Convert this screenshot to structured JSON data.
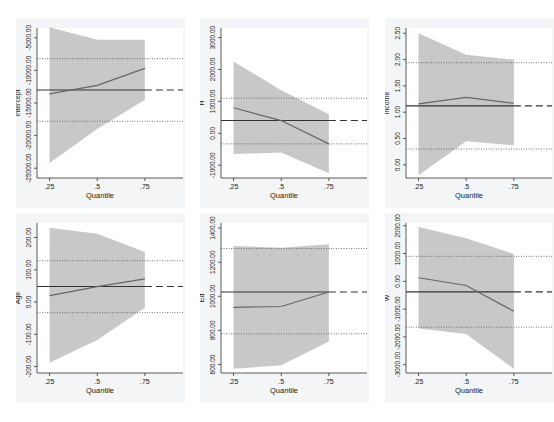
{
  "chart_data": [
    {
      "type": "line",
      "title": "",
      "ylabel": "Intercept",
      "xlabel": "Quantile",
      "x": [
        0.25,
        0.5,
        0.75
      ],
      "xticks": [
        ".25",
        ".5",
        ".75"
      ],
      "yticks": [
        -25000,
        -20000,
        -15000,
        -10000,
        -5000
      ],
      "ytick_labels": [
        "-25000.00",
        "-20000.00",
        "-15000.00",
        "-10000.00",
        "-5000.00"
      ],
      "ylim": [
        -26500,
        -3500
      ],
      "series": [
        {
          "name": "quantile estimate",
          "values": [
            -13600,
            -12300,
            -9700
          ]
        },
        {
          "name": "ci_lower",
          "values": [
            -24200,
            -19000,
            -14500
          ]
        },
        {
          "name": "ci_upper",
          "values": [
            -3400,
            -5300,
            -5300
          ]
        }
      ],
      "ols": -13000,
      "ols_ci": [
        -17800,
        -8200
      ]
    },
    {
      "type": "line",
      "title": "",
      "ylabel": "H",
      "xlabel": "Quantile",
      "x": [
        0.25,
        0.5,
        0.75
      ],
      "xticks": [
        ".25",
        ".5",
        ".75"
      ],
      "yticks": [
        -1000,
        0,
        1000,
        2000,
        3000
      ],
      "ytick_labels": [
        "-1000.00",
        "0.00",
        "1000.00",
        "2000.00",
        "3000.00"
      ],
      "ylim": [
        -1400,
        3300
      ],
      "series": [
        {
          "name": "quantile estimate",
          "values": [
            800,
            400,
            -330
          ]
        },
        {
          "name": "ci_lower",
          "values": [
            -650,
            -600,
            -1250
          ]
        },
        {
          "name": "ci_upper",
          "values": [
            2250,
            1350,
            600
          ]
        }
      ],
      "ols": 400,
      "ols_ci": [
        -330,
        1100
      ]
    },
    {
      "type": "line",
      "title": "",
      "ylabel": "Income",
      "xlabel": "Quantile",
      "x": [
        0.25,
        0.5,
        0.75
      ],
      "xticks": [
        ".25",
        ".5",
        ".75"
      ],
      "yticks": [
        0.0,
        0.5,
        1.0,
        1.5,
        2.0,
        2.5
      ],
      "ytick_labels": [
        "0.00",
        "0.50",
        "1.00",
        "1.50",
        "2.00",
        "2.50"
      ],
      "ylim": [
        -0.25,
        2.6
      ],
      "series": [
        {
          "name": "quantile estimate",
          "values": [
            1.16,
            1.28,
            1.17
          ]
        },
        {
          "name": "ci_lower",
          "values": [
            -0.2,
            0.45,
            0.37
          ]
        },
        {
          "name": "ci_upper",
          "values": [
            2.5,
            2.09,
            2.0
          ]
        }
      ],
      "ols": 1.12,
      "ols_ci": [
        0.3,
        1.94
      ]
    },
    {
      "type": "line",
      "title": "",
      "ylabel": "Age",
      "xlabel": "Quantile",
      "x": [
        0.25,
        0.5,
        0.75
      ],
      "xticks": [
        ".25",
        ".5",
        ".75"
      ],
      "yticks": [
        -200,
        -100,
        0,
        100,
        200
      ],
      "ytick_labels": [
        "-200.00",
        "-100.00",
        "0.00",
        "100.00",
        "200.00"
      ],
      "ylim": [
        -220,
        245
      ],
      "series": [
        {
          "name": "quantile estimate",
          "values": [
            20,
            48,
            72
          ]
        },
        {
          "name": "ci_lower",
          "values": [
            -188,
            -118,
            -18
          ]
        },
        {
          "name": "ci_upper",
          "values": [
            230,
            212,
            155
          ]
        }
      ],
      "ols": 48,
      "ols_ci": [
        -33,
        128
      ]
    },
    {
      "type": "line",
      "title": "",
      "ylabel": "Ed",
      "xlabel": "Quantile",
      "x": [
        0.25,
        0.5,
        0.75
      ],
      "xticks": [
        ".25",
        ".5",
        ".75"
      ],
      "yticks": [
        600,
        800,
        1000,
        1200,
        1400
      ],
      "ytick_labels": [
        "600.00",
        "800.00",
        "1000.00",
        "1200.00",
        "1400.00"
      ],
      "ylim": [
        550,
        1430
      ],
      "series": [
        {
          "name": "quantile estimate",
          "values": [
            935,
            940,
            1025
          ]
        },
        {
          "name": "ci_lower",
          "values": [
            575,
            595,
            735
          ]
        },
        {
          "name": "ci_upper",
          "values": [
            1295,
            1285,
            1305
          ]
        }
      ],
      "ols": 1025,
      "ols_ci": [
        780,
        1280
      ]
    },
    {
      "type": "line",
      "title": "",
      "ylabel": "W",
      "xlabel": "Quantile",
      "x": [
        0.25,
        0.5,
        0.75
      ],
      "xticks": [
        ".25",
        ".5",
        ".75"
      ],
      "yticks": [
        -3000,
        -2000,
        -1000,
        0,
        1000,
        2000
      ],
      "ytick_labels": [
        "-3000.00",
        "-2000.00",
        "-1000.00",
        "0.00",
        "1000.00",
        "2000.00"
      ],
      "ylim": [
        -3300,
        2100
      ],
      "series": [
        {
          "name": "quantile estimate",
          "values": [
            130,
            -150,
            -1080
          ]
        },
        {
          "name": "ci_lower",
          "values": [
            -1700,
            -1900,
            -3150
          ]
        },
        {
          "name": "ci_upper",
          "values": [
            1960,
            1550,
            980
          ]
        }
      ],
      "ols": -380,
      "ols_ci": [
        -1650,
        900
      ]
    }
  ],
  "colors": {
    "band": "#c8c8c8",
    "estimate_line": "#666666",
    "ols_line": "#333333",
    "ci_line": "#555555",
    "panel_bg": "#f4f5f6",
    "plot_bg": "#ffffff"
  }
}
